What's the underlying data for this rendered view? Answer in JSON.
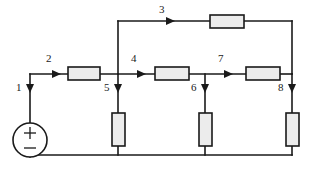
{
  "diagram": {
    "type": "electrical-circuit-schematic",
    "colors": {
      "wire": "#1a1a1a",
      "resistor_fill": "#ececec",
      "background": "#ffffff"
    },
    "source": {
      "name": "independent-voltage-source",
      "plus_label": "+",
      "minus_label": "−"
    },
    "branch_labels": [
      {
        "id": "1",
        "text": "1",
        "direction": "down",
        "x": 16,
        "y": 88,
        "ax": 30,
        "ay": 88
      },
      {
        "id": "2",
        "text": "2",
        "direction": "right",
        "x": 46,
        "y": 57,
        "ax": 52,
        "ay": 68
      },
      {
        "id": "3",
        "text": "3",
        "direction": "right",
        "x": 160,
        "y": 10,
        "ax": 166,
        "ay": 21
      },
      {
        "id": "4",
        "text": "4",
        "direction": "right",
        "x": 131,
        "y": 57,
        "ax": 137,
        "ay": 68
      },
      {
        "id": "5",
        "text": "5",
        "direction": "down",
        "x": 104,
        "y": 88,
        "ax": 118,
        "ay": 88
      },
      {
        "id": "6",
        "text": "6",
        "direction": "down",
        "x": 191,
        "y": 88,
        "ax": 205,
        "ay": 88
      },
      {
        "id": "7",
        "text": "7",
        "direction": "right",
        "x": 218,
        "y": 57,
        "ax": 224,
        "ay": 68
      },
      {
        "id": "8",
        "text": "8",
        "direction": "down",
        "x": 278,
        "y": 88,
        "ax": 292,
        "ay": 88
      }
    ],
    "resistors": [
      {
        "name": "resistor-r2",
        "orientation": "horizontal",
        "x": 68,
        "y": 67,
        "w": 32,
        "h": 13
      },
      {
        "name": "resistor-r3",
        "orientation": "horizontal",
        "x": 210,
        "y": 17,
        "w": 34,
        "h": 13
      },
      {
        "name": "resistor-r4",
        "orientation": "horizontal",
        "x": 155,
        "y": 67,
        "w": 34,
        "h": 13
      },
      {
        "name": "resistor-r7",
        "orientation": "horizontal",
        "x": 246,
        "y": 67,
        "w": 34,
        "h": 13
      },
      {
        "name": "resistor-r5",
        "orientation": "vertical",
        "x": 112,
        "y": 113,
        "w": 13,
        "h": 33
      },
      {
        "name": "resistor-r6",
        "orientation": "vertical",
        "x": 199,
        "y": 113,
        "w": 13,
        "h": 33
      },
      {
        "name": "resistor-r8",
        "orientation": "vertical",
        "x": 286,
        "y": 113,
        "w": 13,
        "h": 33
      }
    ]
  }
}
